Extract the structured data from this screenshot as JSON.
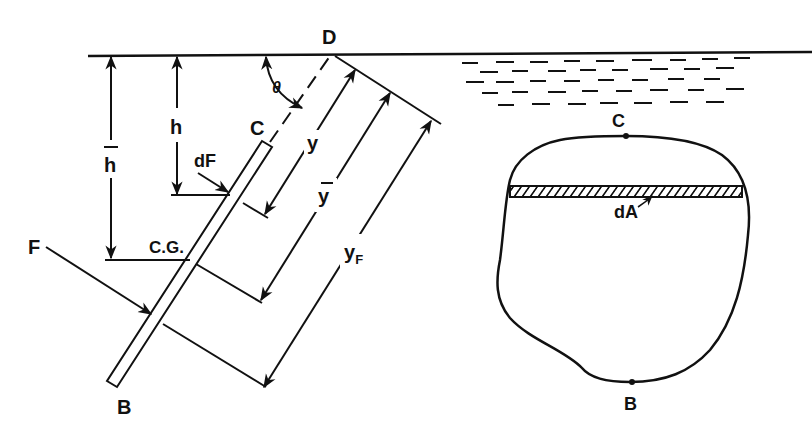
{
  "labels": {
    "D": "D",
    "theta": "θ",
    "C_plate": "C",
    "h": "h",
    "h_bar": "h",
    "dF": "dF",
    "y": "y",
    "y_bar": "y",
    "y_F_main": "y",
    "y_F_sub": "F",
    "CG": "C.G.",
    "F": "F",
    "B_plate": "B",
    "C_area": "C",
    "B_area": "B",
    "dA": "dA"
  },
  "colors": {
    "ink": "#111111",
    "background": "#ffffff"
  }
}
